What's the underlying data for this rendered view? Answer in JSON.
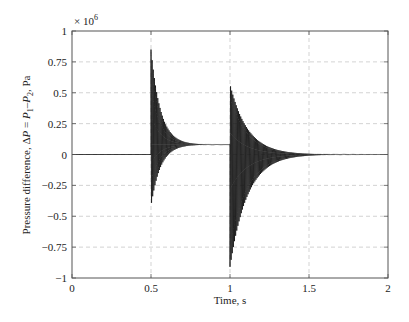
{
  "chart_data": {
    "type": "line",
    "title": "",
    "xlabel": "Time, s",
    "ylabel": "Pressure difference, ΔP = P₁–P₂, Pa",
    "ylabel_parts": {
      "prefix": "Pressure difference, Δ",
      "P": "P",
      "eq": " = ",
      "P1": "P",
      "sub1": "1",
      "dash": "–",
      "P2": "P",
      "sub2": "2",
      "suffix": ", Pa"
    },
    "y_multiplier": "× 10",
    "y_multiplier_exp": "6",
    "xlim": [
      0,
      2
    ],
    "ylim": [
      -1,
      1
    ],
    "xticks": [
      0,
      0.5,
      1,
      1.5,
      2
    ],
    "xtick_labels": [
      "0",
      "0.5",
      "1",
      "1.5",
      "2"
    ],
    "yticks": [
      -1,
      -0.75,
      -0.5,
      -0.25,
      0,
      0.25,
      0.5,
      0.75,
      1
    ],
    "ytick_labels": [
      "−1",
      "−0.75",
      "−0.5",
      "−0.25",
      "0",
      "0.25",
      "0.5",
      "0.75",
      "1"
    ],
    "grid": true,
    "legend": null,
    "series": [
      {
        "name": "Pressure difference (×10^6 Pa)",
        "segments": [
          {
            "t_start": 0.0,
            "t_end": 0.5,
            "kind": "constant",
            "value": 0.0
          },
          {
            "t_start": 0.5,
            "t_end": 1.0,
            "kind": "damped_oscillation",
            "baseline": 0.08,
            "peak_max": 0.85,
            "peak_min": -0.42,
            "decay_time_s": 0.06,
            "freq_hz": 140,
            "settled_value": 0.08
          },
          {
            "t_start": 1.0,
            "t_end": 2.0,
            "kind": "damped_oscillation",
            "baseline": 0.0,
            "peak_max": 0.57,
            "peak_min": -0.91,
            "decay_time_s": 0.11,
            "freq_hz": 140,
            "settled_value": 0.0
          }
        ],
        "key_points": [
          {
            "t": 0.0,
            "value": 0.0
          },
          {
            "t": 0.5,
            "value": 0.85
          },
          {
            "t": 0.505,
            "value": -0.42
          },
          {
            "t": 0.75,
            "value": 0.08
          },
          {
            "t": 1.0,
            "value": 0.08
          },
          {
            "t": 1.005,
            "value": 0.57
          },
          {
            "t": 1.0,
            "value": -0.91
          },
          {
            "t": 1.5,
            "value": 0.0
          },
          {
            "t": 2.0,
            "value": 0.0
          }
        ]
      }
    ]
  }
}
